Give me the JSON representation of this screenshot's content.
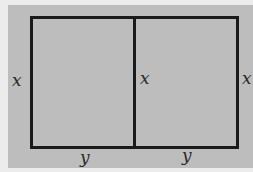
{
  "diagram": {
    "labels": {
      "left_side": "x",
      "middle_divider": "x",
      "right_side": "x",
      "bottom_left": "y",
      "bottom_right": "y"
    },
    "colors": {
      "background": "#ececec",
      "panel": "#bdbdbd",
      "lines": "#1a1a1a"
    }
  }
}
